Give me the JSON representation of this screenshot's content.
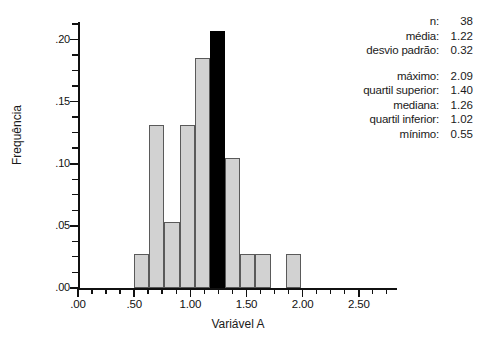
{
  "chart_data": {
    "type": "bar",
    "title": "",
    "subtitle": "",
    "xlabel": "Variável A",
    "ylabel": "Frequência",
    "xlim": [
      0.0,
      2.84
    ],
    "ylim": [
      0.0,
      0.2125
    ],
    "grid": false,
    "legend": "none",
    "bin_width": 0.135,
    "x_tick_labels": [
      ".00",
      ".50",
      "1.00",
      "1.50",
      "2.00",
      "2.50"
    ],
    "x_tick_values": [
      0.0,
      0.5,
      1.0,
      1.5,
      2.0,
      2.5
    ],
    "x_minor_step": 0.125,
    "y_tick_labels": [
      ".00",
      ".05",
      ".10",
      ".15",
      ".20"
    ],
    "y_tick_values": [
      0.0,
      0.05,
      0.1,
      0.15,
      0.2
    ],
    "y_minor_step": 0.0125,
    "bar_fill": "#d2d2d2",
    "bar_edge": "#5a5a5a",
    "highlight_fill": "#000000",
    "bars": [
      {
        "x0": 0.5,
        "x1": 0.635,
        "value": 0.027,
        "highlight": false
      },
      {
        "x0": 0.635,
        "x1": 0.77,
        "value": 0.131,
        "highlight": false
      },
      {
        "x0": 0.77,
        "x1": 0.905,
        "value": 0.053,
        "highlight": false
      },
      {
        "x0": 0.905,
        "x1": 1.04,
        "value": 0.131,
        "highlight": false
      },
      {
        "x0": 1.04,
        "x1": 1.175,
        "value": 0.185,
        "highlight": false
      },
      {
        "x0": 1.175,
        "x1": 1.31,
        "value": 0.207,
        "highlight": true
      },
      {
        "x0": 1.31,
        "x1": 1.445,
        "value": 0.105,
        "highlight": false
      },
      {
        "x0": 1.445,
        "x1": 1.58,
        "value": 0.027,
        "highlight": false
      },
      {
        "x0": 1.58,
        "x1": 1.715,
        "value": 0.027,
        "highlight": false
      },
      {
        "x0": 1.85,
        "x1": 1.985,
        "value": 0.027,
        "highlight": false
      }
    ]
  },
  "stats": {
    "rows_top": [
      {
        "label": "n:",
        "value": "38"
      },
      {
        "label": "média:",
        "value": "1.22"
      },
      {
        "label": "desvio padrão:",
        "value": "0.32"
      }
    ],
    "rows_bottom": [
      {
        "label": "máximo:",
        "value": "2.09"
      },
      {
        "label": "quartil superior:",
        "value": "1.40"
      },
      {
        "label": "mediana:",
        "value": "1.26"
      },
      {
        "label": "quartil inferior:",
        "value": "1.02"
      },
      {
        "label": "mínimo:",
        "value": "0.55"
      }
    ]
  }
}
